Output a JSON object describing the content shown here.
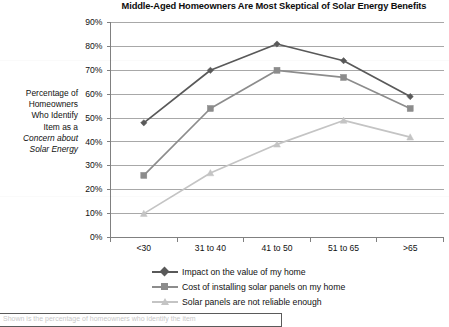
{
  "chart_data": {
    "type": "line",
    "title": "Middle-Aged Homeowners Are Most Skeptical of Solar Energy Benefits",
    "xlabel": "",
    "ylabel": "Percentage of Homeowners Who Identify Item as a Concern about Solar Energy",
    "ylabel_lines": [
      "Percentage of",
      "Homeowners",
      "Who Identify",
      "Item as a",
      "Concern about",
      "Solar Energy"
    ],
    "ylabel_italic_lines": [
      "Concern about",
      "Solar Energy"
    ],
    "categories": [
      "<30",
      "31 to 40",
      "41 to 50",
      "51 to 65",
      ">65"
    ],
    "ylim": [
      0,
      90
    ],
    "ytick_step": 10,
    "ytick_labels": [
      "0%",
      "10%",
      "20%",
      "30%",
      "40%",
      "50%",
      "60%",
      "70%",
      "80%",
      "90%"
    ],
    "yvalues": [
      0,
      10,
      20,
      30,
      40,
      50,
      60,
      70,
      80,
      90
    ],
    "grid": true,
    "grid_axis": "y",
    "legend_position": "bottom",
    "series": [
      {
        "name": "Impact on the value of my home",
        "marker": "diamond",
        "color": "#595959",
        "values": [
          48,
          70,
          81,
          74,
          59
        ]
      },
      {
        "name": "Cost of installing solar panels on my home",
        "marker": "square",
        "color": "#8c8c8c",
        "values": [
          26,
          54,
          70,
          67,
          54
        ]
      },
      {
        "name": "Solar panels are not reliable enough",
        "marker": "triangle",
        "color": "#c4c4c4",
        "values": [
          10,
          27,
          39,
          49,
          42
        ]
      }
    ]
  },
  "colors": {
    "series_1": "#595959",
    "series_2": "#8c8c8c",
    "series_3": "#c4c4c4",
    "axis": "#808080",
    "gridline": "#9e9e9e",
    "text": "#111111"
  },
  "footer": {
    "clipped_text": "Shown is the percentage of homeowners who identify the item"
  }
}
